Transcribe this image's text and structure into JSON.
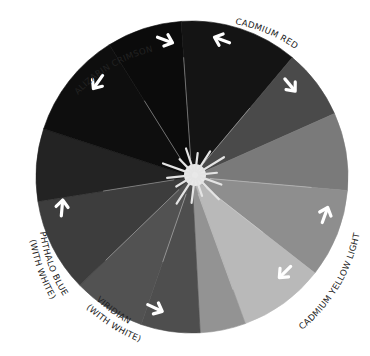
{
  "wheel": {
    "center": [
      192,
      177
    ],
    "radius": 156,
    "center_color": "#e8e8e8",
    "wedges": [
      {
        "name": "alizarin-crimson-dark",
        "start": -32,
        "end": -4,
        "color": "#0b0b0b"
      },
      {
        "name": "cadmium-red-dark",
        "start": -4,
        "end": 40,
        "color": "#141414"
      },
      {
        "name": "cadmium-red-mix",
        "start": 40,
        "end": 66,
        "color": "#4a4a4a"
      },
      {
        "name": "orange-mix",
        "start": 66,
        "end": 95,
        "color": "#7a7a7a"
      },
      {
        "name": "yellow-orange-mix",
        "start": 95,
        "end": 128,
        "color": "#8e8e8e"
      },
      {
        "name": "cadmium-yellow-light",
        "start": 128,
        "end": 160,
        "color": "#b9b9b9"
      },
      {
        "name": "yellow-green-mix",
        "start": 160,
        "end": 177,
        "color": "#939393"
      },
      {
        "name": "green-mix",
        "start": 177,
        "end": 199,
        "color": "#4e4e4e"
      },
      {
        "name": "viridian-with-white",
        "start": 199,
        "end": 226,
        "color": "#525252"
      },
      {
        "name": "blue-green-mix",
        "start": 226,
        "end": 261,
        "color": "#3d3d3d"
      },
      {
        "name": "phthalo-blue-with-white",
        "start": 261,
        "end": 288,
        "color": "#232323"
      },
      {
        "name": "violet-mix",
        "start": 288,
        "end": 328,
        "color": "#0e0e0e"
      }
    ]
  },
  "labels": {
    "alizarin_crimson": "ALIZARIN CRIMSON",
    "cadmium_red": "CADMIUM RED",
    "cadmium_yellow_light": "CADMIUM YELLOW LIGHT",
    "phthalo_blue_line1": "PHTHALO BLUE",
    "phthalo_blue_line2": "(WITH WHITE)",
    "viridian_line1": "VIRIDIAN",
    "viridian_line2": "(WITH WHITE)"
  },
  "arrows": [
    {
      "name": "arrow-alizarin-right",
      "x": 165,
      "y": 40,
      "rot": 20
    },
    {
      "name": "arrow-cadmium-red-left",
      "x": 222,
      "y": 40,
      "rot": 200
    },
    {
      "name": "arrow-alizarin-down",
      "x": 98,
      "y": 82,
      "rot": 125
    },
    {
      "name": "arrow-cadmium-red-down",
      "x": 290,
      "y": 85,
      "rot": 50
    },
    {
      "name": "arrow-phthalo-up",
      "x": 62,
      "y": 208,
      "rot": -85
    },
    {
      "name": "arrow-yellow-up",
      "x": 325,
      "y": 215,
      "rot": -70
    },
    {
      "name": "arrow-yellow-down",
      "x": 285,
      "y": 272,
      "rot": 135
    },
    {
      "name": "arrow-viridian-right",
      "x": 155,
      "y": 308,
      "rot": 25
    }
  ]
}
